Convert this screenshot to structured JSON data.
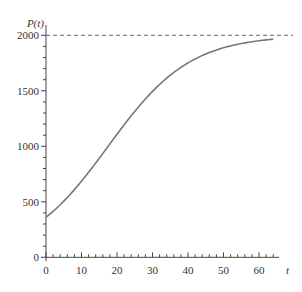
{
  "chart_data": {
    "type": "line",
    "title": "",
    "xlabel": "t",
    "ylabel": "P(t)",
    "xlim": [
      0,
      65
    ],
    "ylim": [
      0,
      2000
    ],
    "x_ticks": [
      0,
      10,
      20,
      30,
      40,
      50,
      60
    ],
    "x_tick_labels": [
      "0",
      "10",
      "20",
      "30",
      "40",
      "50",
      "60"
    ],
    "x_minor_step": 2,
    "y_ticks": [
      0,
      500,
      1000,
      1500,
      2000
    ],
    "y_tick_labels": [
      "0",
      "500",
      "1000",
      "1500",
      "2000"
    ],
    "y_minor_step": 100,
    "grid": false,
    "series": [
      {
        "name": "P(t) logistic",
        "model": "P(t) = 2000 / (1 + 4.56 e^(-0.0867 t))",
        "x": [
          0,
          5,
          10,
          15,
          20,
          25,
          30,
          35,
          40,
          45,
          50,
          55,
          60,
          64
        ],
        "y": [
          360,
          502,
          680,
          890,
          1110,
          1330,
          1505,
          1640,
          1750,
          1830,
          1885,
          1925,
          1950,
          1965
        ],
        "color": "#777777"
      }
    ],
    "reference_lines": [
      {
        "axis": "y",
        "value": 2000,
        "style": "dashed",
        "label": "carrying capacity"
      }
    ]
  }
}
